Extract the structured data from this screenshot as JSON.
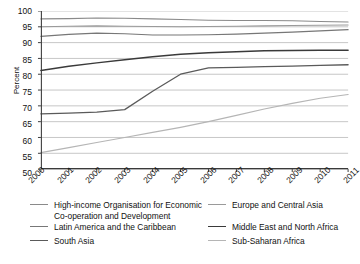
{
  "chart_data": {
    "type": "line",
    "title": "",
    "xlabel": "",
    "ylabel": "Percent",
    "grid": true,
    "legend_position": "bottom",
    "x": [
      2000,
      2001,
      2002,
      2003,
      2004,
      2005,
      2006,
      2007,
      2008,
      2009,
      2010,
      2011
    ],
    "xtick_labels": [
      "2000",
      "2001",
      "2002",
      "2003",
      "2004",
      "2005",
      "2006",
      "2007",
      "2008",
      "2009",
      "2010",
      "2011"
    ],
    "ytick_labels": [
      "100",
      "95",
      "90",
      "85",
      "80",
      "75",
      "70",
      "65",
      "60",
      "55",
      "50"
    ],
    "ylim": [
      50,
      100
    ],
    "ytick_step": 5,
    "series": [
      {
        "name": "High-income Organisation for Economic Co-operation and Development",
        "color": "#8a8a8a",
        "width": 1.1,
        "values": [
          97.5,
          97.6,
          97.8,
          97.7,
          97.5,
          97.3,
          97.1,
          97.0,
          97.0,
          96.9,
          96.7,
          96.5
        ]
      },
      {
        "name": "Europe and Central Asia",
        "color": "#9a9a9a",
        "width": 1.1,
        "values": [
          95.0,
          95.2,
          95.3,
          95.2,
          95.1,
          95.0,
          95.1,
          95.2,
          95.3,
          95.4,
          95.5,
          95.6
        ]
      },
      {
        "name": "Latin America and the Caribbean",
        "color": "#777777",
        "width": 1.2,
        "values": [
          92.0,
          92.6,
          93.0,
          92.8,
          92.4,
          92.4,
          92.5,
          92.7,
          93.0,
          93.3,
          93.7,
          94.1
        ]
      },
      {
        "name": "Middle East and North Africa",
        "color": "#3a3a3a",
        "width": 1.5,
        "values": [
          81.2,
          82.5,
          83.6,
          84.6,
          85.5,
          86.3,
          86.8,
          87.1,
          87.4,
          87.5,
          87.6,
          87.6
        ]
      },
      {
        "name": "South Asia",
        "color": "#5a5a5a",
        "width": 1.3,
        "values": [
          67.5,
          67.7,
          68.0,
          68.8,
          74.6,
          80.0,
          82.0,
          82.2,
          82.4,
          82.6,
          82.8,
          83.0
        ]
      },
      {
        "name": "Sub-Saharan Africa",
        "color": "#b5b5b5",
        "width": 1.2,
        "values": [
          55.2,
          56.8,
          58.4,
          60.0,
          61.6,
          63.2,
          65.0,
          67.0,
          69.0,
          70.8,
          72.4,
          73.6
        ]
      }
    ]
  },
  "legend": {
    "entries": [
      {
        "label_line1": "High-income Organisation for Economic",
        "label_line2": "Co-operation and Development",
        "color": "#8a8a8a",
        "width": 1.1
      },
      {
        "label_line1": "Europe and Central Asia",
        "label_line2": "",
        "color": "#9a9a9a",
        "width": 1.1
      },
      {
        "label_line1": "Latin America and the Caribbean",
        "label_line2": "",
        "color": "#777777",
        "width": 1.2
      },
      {
        "label_line1": "Middle East and North Africa",
        "label_line2": "",
        "color": "#3a3a3a",
        "width": 1.8
      },
      {
        "label_line1": "South Asia",
        "label_line2": "",
        "color": "#5a5a5a",
        "width": 1.3
      },
      {
        "label_line1": "Sub-Saharan Africa",
        "label_line2": "",
        "color": "#b5b5b5",
        "width": 1.2
      }
    ]
  }
}
